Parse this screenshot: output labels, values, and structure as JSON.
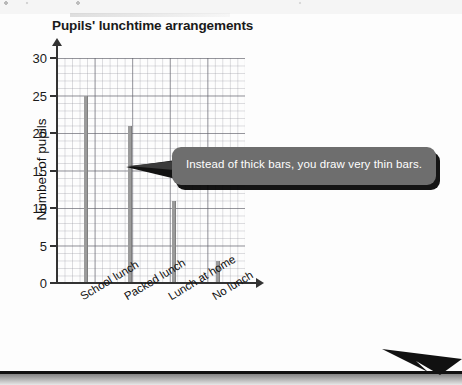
{
  "chart_data": {
    "type": "bar",
    "title": "Pupils' lunchtime arrangements",
    "xlabel": "",
    "ylabel": "Number of pupils",
    "categories": [
      "School lunch",
      "Packed lunch",
      "Lunch at home",
      "No lunch"
    ],
    "values": [
      25,
      21,
      11,
      3
    ],
    "ylim": [
      0,
      30
    ],
    "ytick_labels": [
      "0",
      "5",
      "10",
      "15",
      "20",
      "25",
      "30"
    ],
    "ytick_values": [
      0,
      5,
      10,
      15,
      20,
      25,
      30
    ],
    "grid": true,
    "grid_style": "graph-paper (minor squares + bold every 5 units)",
    "legend": "none",
    "bar_style": "very thin bars",
    "bar_color": "#9b9b9b",
    "axis_color": "#333333"
  },
  "annotation": {
    "callout_text": "Instead of thick bars, you draw very thin bars.",
    "callout_bg": "#6e6e6e",
    "callout_text_color": "#ffffff"
  },
  "page_furniture": {
    "rule_color": "#111111",
    "arrow_name": "page-turn-arrow"
  }
}
